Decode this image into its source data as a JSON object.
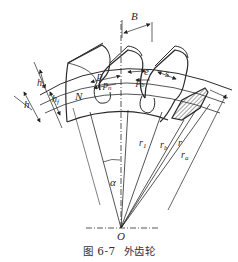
{
  "figure": {
    "number": "图 6-7",
    "title": "外齿轮"
  },
  "labels": {
    "B": "B",
    "p": "p",
    "pn": "p",
    "pn_sub": "n",
    "e": "e",
    "s": "s",
    "pb": "p",
    "pb_sub": "b",
    "ha": "h",
    "ha_sub": "a",
    "hf": "h",
    "hf_sub": "f",
    "h": "h",
    "N": "N",
    "r1": "r",
    "r1_sub": "1",
    "rb": "r",
    "rb_sub": "b",
    "r": "r",
    "ra": "r",
    "ra_sub": "a",
    "alpha": "α",
    "O": "O"
  },
  "colors": {
    "line": "#2a2a2a",
    "hatch": "#555555",
    "background": "#ffffff"
  }
}
